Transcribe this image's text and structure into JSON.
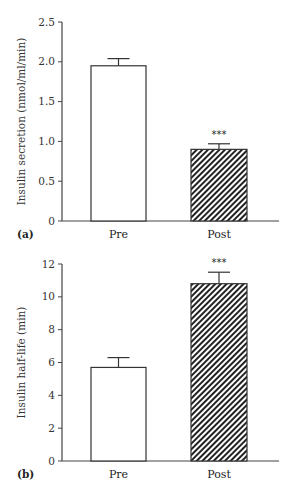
{
  "chart_data": [
    {
      "panel": "(a)",
      "type": "bar",
      "categories": [
        "Pre",
        "Post"
      ],
      "values": [
        1.95,
        0.9
      ],
      "error_upper": [
        2.04,
        0.97
      ],
      "significance": [
        "",
        "***"
      ],
      "fill": [
        "white",
        "hatched"
      ],
      "title": "",
      "xlabel": "",
      "ylabel": "Insulin secretion (nmol/ml/min)",
      "ylim": [
        0,
        2.5
      ],
      "yticks": [
        "0",
        "0.5",
        "1.0",
        "1.5",
        "2.0",
        "2.5"
      ],
      "grid": false
    },
    {
      "panel": "(b)",
      "type": "bar",
      "categories": [
        "Pre",
        "Post"
      ],
      "values": [
        5.7,
        10.8
      ],
      "error_upper": [
        6.3,
        11.5
      ],
      "significance": [
        "",
        "***"
      ],
      "fill": [
        "white",
        "hatched"
      ],
      "title": "",
      "xlabel": "",
      "ylabel": "Insulin half-life (min)",
      "ylim": [
        0,
        12
      ],
      "yticks": [
        "0",
        "2",
        "4",
        "6",
        "8",
        "10",
        "12"
      ],
      "grid": false
    }
  ]
}
